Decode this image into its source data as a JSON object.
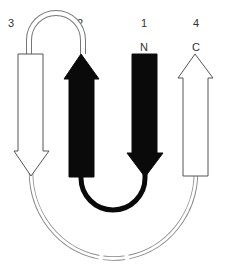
{
  "diagram": {
    "colors": {
      "filled_strand": "#0a0a0a",
      "open_strand_fill": "#ffffff",
      "outline": "#555555",
      "loop_line": "#777777",
      "label": "#333333",
      "background": "#ffffff"
    },
    "strands": [
      {
        "id": "3",
        "label": "3",
        "direction": "down",
        "style": "open"
      },
      {
        "id": "2",
        "label": "2",
        "direction": "up",
        "style": "filled"
      },
      {
        "id": "1",
        "label": "1",
        "direction": "down",
        "style": "filled",
        "terminus": "N"
      },
      {
        "id": "4",
        "label": "4",
        "direction": "up",
        "style": "open",
        "terminus": "C"
      }
    ],
    "termini": {
      "n": "N",
      "c": "C"
    },
    "connections": [
      {
        "from": "1",
        "to": "2",
        "style": "filled-loop",
        "position": "bottom"
      },
      {
        "from": "2",
        "to": "3",
        "style": "double-line-loop",
        "position": "top"
      },
      {
        "from": "3",
        "to": "4",
        "style": "double-line-arc-dashed",
        "position": "bottom"
      }
    ]
  }
}
